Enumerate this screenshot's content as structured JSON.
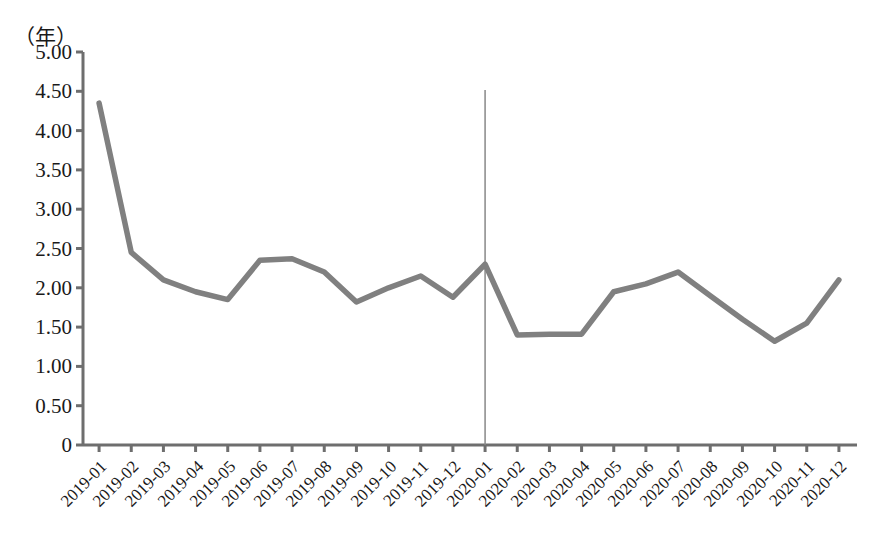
{
  "chart_data": {
    "type": "line",
    "title": "",
    "subtitle": "",
    "xlabel": "",
    "ylabel": "",
    "unit_label": "（年）",
    "ylim": [
      0,
      5.0
    ],
    "ytick_labels": [
      "5.00",
      "4.50",
      "4.00",
      "3.50",
      "3.00",
      "2.50",
      "2.00",
      "1.50",
      "1.00",
      "0.50",
      "0"
    ],
    "ytick_values": [
      5.0,
      4.5,
      4.0,
      3.5,
      3.0,
      2.5,
      2.0,
      1.5,
      1.0,
      0.5,
      0
    ],
    "grid": false,
    "legend": null,
    "legend_position": "none",
    "line_color": "#808080",
    "line_width": 5.5,
    "markers": false,
    "categories": [
      "2019-01",
      "2019-02",
      "2019-03",
      "2019-04",
      "2019-05",
      "2019-06",
      "2019-07",
      "2019-08",
      "2019-09",
      "2019-10",
      "2019-11",
      "2019-12",
      "2020-01",
      "2020-02",
      "2020-03",
      "2020-04",
      "2020-05",
      "2020-06",
      "2020-07",
      "2020-08",
      "2020-09",
      "2020-10",
      "2020-11",
      "2020-12"
    ],
    "values": [
      4.35,
      2.45,
      2.1,
      1.95,
      1.85,
      2.35,
      2.37,
      2.2,
      1.82,
      2.0,
      2.15,
      1.88,
      2.3,
      1.4,
      1.41,
      1.41,
      1.95,
      2.05,
      2.2,
      1.9,
      1.6,
      1.32,
      1.55,
      2.1
    ],
    "annotations": [
      {
        "type": "vertical-line",
        "at_category": "2020-01",
        "color": "#888888",
        "width": 1.5,
        "label": ""
      }
    ]
  }
}
